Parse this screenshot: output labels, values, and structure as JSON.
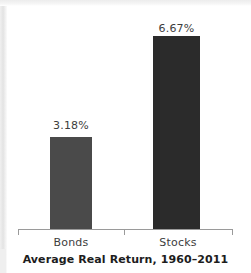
{
  "chart_data": {
    "type": "bar",
    "title": "Average Real Return, 1960–2011",
    "xlabel": "",
    "ylabel": "",
    "categories": [
      "Bonds",
      "Stocks"
    ],
    "values": [
      3.18,
      6.67
    ],
    "value_labels": [
      "3.18%",
      "6.67%"
    ],
    "units": "percent",
    "ylim": [
      0,
      7.4
    ],
    "grid": false,
    "legend": null,
    "axis": {
      "show_y_axis": false,
      "show_x_axis": true,
      "x_ticks": [
        "",
        "",
        ""
      ],
      "tick_positions": [
        "left-end",
        "center",
        "right-end"
      ]
    },
    "series": [
      {
        "name": "Average Real Return, 1960–2011",
        "points": [
          {
            "category": "Bonds",
            "value": 3.18,
            "label": "3.18%",
            "color": "#4a4a4a"
          },
          {
            "category": "Stocks",
            "value": 6.67,
            "label": "6.67%",
            "color": "#2b2b2b"
          }
        ]
      }
    ]
  },
  "style": {
    "background": "#ffffff",
    "axis_color": "#9a9a9a",
    "label_color": "#3d3d3d",
    "title_color": "#1d1d1d",
    "bar_colors": [
      "#4a4a4a",
      "#2b2b2b"
    ]
  }
}
